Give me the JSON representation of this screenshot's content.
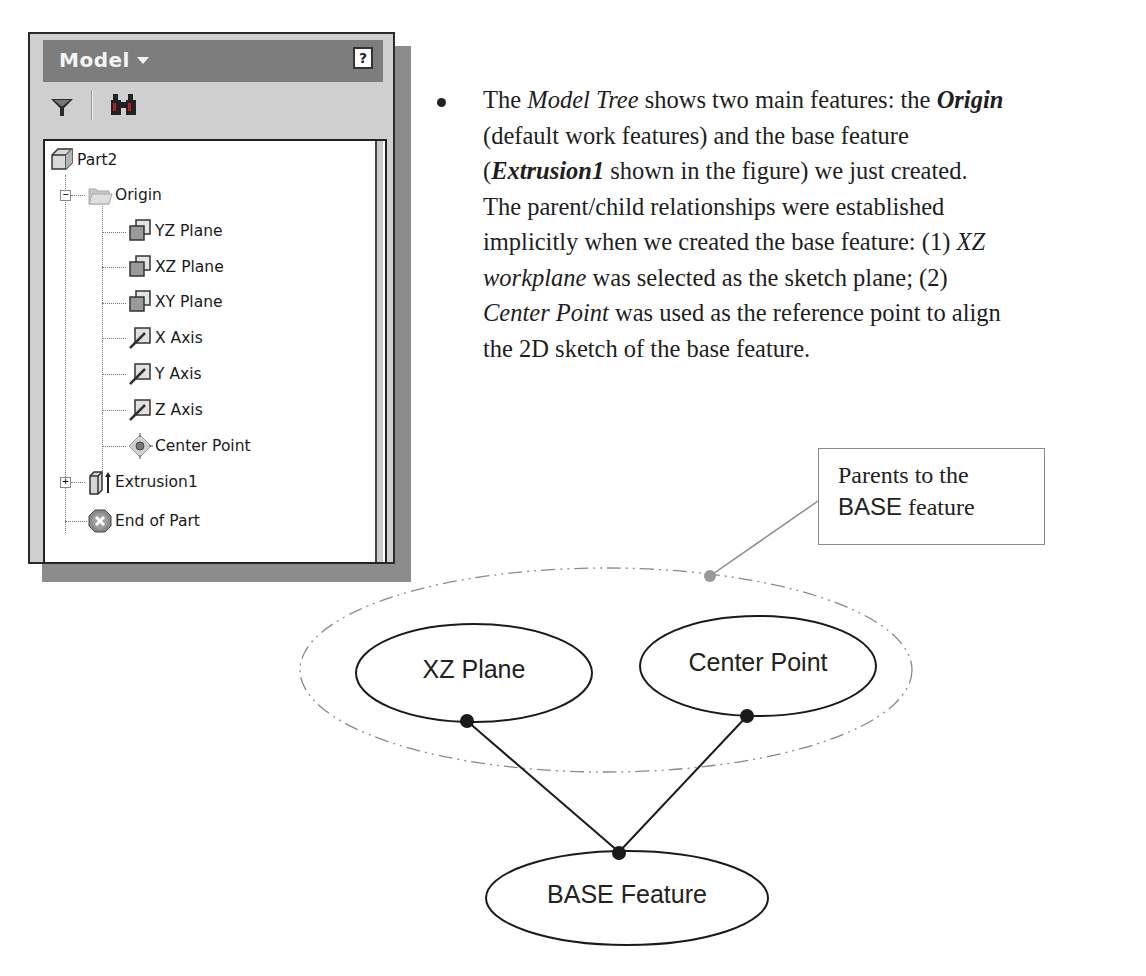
{
  "model_browser": {
    "title": "Model",
    "help_label": "?",
    "toolbar": {
      "filter_icon": "funnel-icon",
      "find_icon": "binoculars-icon"
    },
    "tree": [
      {
        "label": "Part2",
        "icon": "part-cube-icon",
        "level": 0
      },
      {
        "label": "Origin",
        "icon": "folder-icon",
        "level": 1,
        "toggle": "−",
        "expanded": true
      },
      {
        "label": "YZ Plane",
        "icon": "work-plane-icon",
        "level": 2
      },
      {
        "label": "XZ Plane",
        "icon": "work-plane-icon",
        "level": 2
      },
      {
        "label": "XY Plane",
        "icon": "work-plane-icon",
        "level": 2
      },
      {
        "label": "X Axis",
        "icon": "work-axis-icon",
        "level": 2
      },
      {
        "label": "Y Axis",
        "icon": "work-axis-icon",
        "level": 2
      },
      {
        "label": "Z Axis",
        "icon": "work-axis-icon",
        "level": 2
      },
      {
        "label": "Center Point",
        "icon": "work-point-icon",
        "level": 2
      },
      {
        "label": "Extrusion1",
        "icon": "extrusion-icon",
        "level": 1,
        "toggle": "+",
        "expanded": false
      },
      {
        "label": "End of Part",
        "icon": "end-of-part-icon",
        "level": 1
      }
    ]
  },
  "paragraph": {
    "lines": [
      [
        {
          "t": "The ",
          "s": "n"
        },
        {
          "t": "Model Tree",
          "s": "i"
        },
        {
          "t": " shows two main features: the ",
          "s": "n"
        },
        {
          "t": "Origin",
          "s": "bi"
        }
      ],
      [
        {
          "t": "(default work features) and the base feature",
          "s": "n"
        }
      ],
      [
        {
          "t": "(",
          "s": "n"
        },
        {
          "t": "Extrusion1",
          "s": "bi"
        },
        {
          "t": " shown in the figure) we just created.",
          "s": "n"
        }
      ],
      [
        {
          "t": "The parent/child relationships were established",
          "s": "n"
        }
      ],
      [
        {
          "t": "implicitly when we created the base feature: (1) ",
          "s": "n"
        },
        {
          "t": "XZ",
          "s": "i"
        }
      ],
      [
        {
          "t": "workplane",
          "s": "i"
        },
        {
          "t": " was selected as the sketch plane; (2)",
          "s": "n"
        }
      ],
      [
        {
          "t": "Center Point",
          "s": "i"
        },
        {
          "t": " was used as the reference point to align",
          "s": "n"
        }
      ],
      [
        {
          "t": "the 2D sketch of the base feature.",
          "s": "n"
        }
      ]
    ]
  },
  "diagram": {
    "callout": {
      "line1": "Parents to the",
      "line2_sans": "BASE",
      "line2_rest": " feature"
    },
    "nodes": {
      "xz_plane": "XZ Plane",
      "center_point": "Center Point",
      "base_feature": "BASE Feature"
    },
    "colors": {
      "stroke": "#1a1a1a",
      "group_outline": "#8a8a8a",
      "leader_dot": "#9a9a9a"
    }
  }
}
